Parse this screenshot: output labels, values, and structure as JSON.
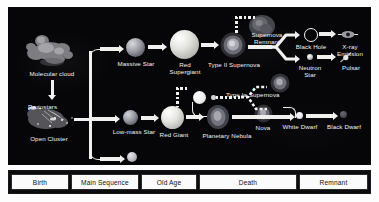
{
  "figure": {
    "background_color": "#060608",
    "arrow_color": "#f0f0ee",
    "label_color": "#f2f2f2"
  },
  "objects": {
    "molecular_cloud": "Molecular cloud",
    "protostars": "Protostars",
    "open_cluster": "Open Cluster",
    "massive_star": "Massive Star",
    "red_supergiant": "Red Supergiant",
    "type_ii_supernova": "Type II Supernova",
    "supernova_remnant": "Supernova Remnant",
    "black_hole": "Black Hole",
    "xray_emission": "X-ray Emission",
    "neutron_star": "Neutron Star",
    "pulsar": "Pulsar",
    "low_mass_star": "Low-mass Star",
    "brown_dwarf": "Brown Dwarf",
    "red_giant": "Red Giant",
    "planetary_nebula": "Planetary Nebula",
    "type_ia_supernova": "Type Ia Supernova",
    "nova": "Nova",
    "white_dwarf": "White Dwarf",
    "black_dwarf": "Black Dwarf"
  },
  "stages": [
    {
      "label": "Birth"
    },
    {
      "label": "Main Sequence"
    },
    {
      "label": "Old Age"
    },
    {
      "label": "Death"
    },
    {
      "label": "Remnant"
    }
  ]
}
